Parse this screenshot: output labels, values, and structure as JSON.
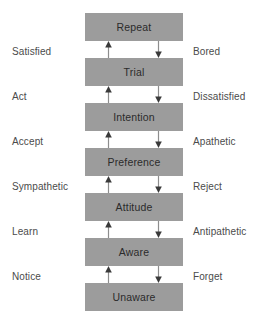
{
  "diagram": {
    "type": "flow-ladder",
    "colors": {
      "box_fill": "#9c9c9c",
      "box_text": "#2b2b2b",
      "side_label_text": "#4b4b4b",
      "arrow_line": "#8d8d8d",
      "arrow_head": "#3a3a3a",
      "background": "#ffffff"
    },
    "stages": [
      {
        "label": "Repeat"
      },
      {
        "label": "Trial"
      },
      {
        "label": "Intention"
      },
      {
        "label": "Preference"
      },
      {
        "label": "Attitude"
      },
      {
        "label": "Aware"
      },
      {
        "label": "Unaware"
      }
    ],
    "transitions": [
      {
        "up_label": "Satisfied",
        "down_label": "Bored"
      },
      {
        "up_label": "Act",
        "down_label": "Dissatisfied"
      },
      {
        "up_label": "Accept",
        "down_label": "Apathetic"
      },
      {
        "up_label": "Sympathetic",
        "down_label": "Reject"
      },
      {
        "up_label": "Learn",
        "down_label": "Antipathetic"
      },
      {
        "up_label": "Notice",
        "down_label": "Forget"
      }
    ]
  }
}
